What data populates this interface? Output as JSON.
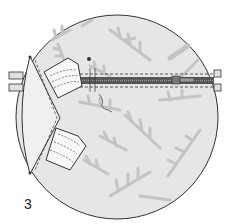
{
  "diagram": {
    "step_number": "3",
    "colors": {
      "fabric_fill": "#e6e6e6",
      "leaf_pattern": "#c4c4c4",
      "outline": "#333333",
      "panel_fill": "#f2f2f2",
      "zipper": "#555555"
    },
    "parts": [
      "circular-fabric-panel",
      "zipper",
      "zipper-pull",
      "left-gusset-panel",
      "upper-tab",
      "lower-tab",
      "left-zipper-end-tabs",
      "right-zipper-end-tabs",
      "stitching-lines",
      "loose-thread",
      "pin-marker"
    ]
  }
}
